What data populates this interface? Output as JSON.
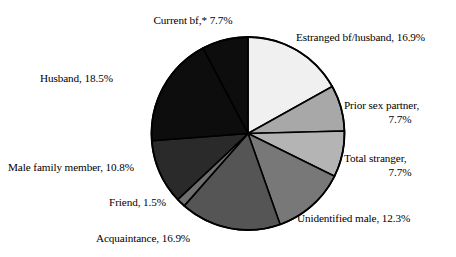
{
  "chart_data": {
    "type": "pie",
    "title": "",
    "subtitle": "",
    "xlabel": "",
    "ylabel": "",
    "legend_position": "none",
    "grid": false,
    "units": "percent",
    "start_angle_deg": 0,
    "direction": "clockwise",
    "total": 100.0,
    "categories": [
      "Estranged bf/husband",
      "Prior sex partner",
      "Total stranger",
      "Unidentified male",
      "Acquaintance",
      "Friend",
      "Male family member",
      "Husband",
      "Current bf,*"
    ],
    "values": [
      16.9,
      7.7,
      7.7,
      12.3,
      16.9,
      1.5,
      10.8,
      18.5,
      7.7
    ],
    "colors": [
      "#f0f0f0",
      "#a8a8a8",
      "#b4b4b4",
      "#787878",
      "#555555",
      "#6e6e6e",
      "#2a2a2a",
      "#0d0d0d",
      "#0d0d0d"
    ],
    "slice_border_color": "#000000",
    "annotations": [
      "* asterisk on 'Current bf' denotes a footnote marker"
    ],
    "slices": [
      {
        "name": "Estranged bf/husband",
        "value": 16.9,
        "label": "Estranged bf/husband, 16.9%",
        "color": "#f0f0f0"
      },
      {
        "name": "Prior sex partner",
        "value": 7.7,
        "label": "Prior sex partner, 7.7%",
        "color": "#a8a8a8"
      },
      {
        "name": "Total stranger",
        "value": 7.7,
        "label": "Total stranger, 7.7%",
        "color": "#b4b4b4"
      },
      {
        "name": "Unidentified male",
        "value": 12.3,
        "label": "Unidentified male, 12.3%",
        "color": "#787878"
      },
      {
        "name": "Acquaintance",
        "value": 16.9,
        "label": "Acquaintance, 16.9%",
        "color": "#555555"
      },
      {
        "name": "Friend",
        "value": 1.5,
        "label": "Friend, 1.5%",
        "color": "#6e6e6e"
      },
      {
        "name": "Male family member",
        "value": 10.8,
        "label": "Male family member, 10.8%",
        "color": "#2a2a2a"
      },
      {
        "name": "Husband",
        "value": 18.5,
        "label": "Husband, 18.5%",
        "color": "#0d0d0d"
      },
      {
        "name": "Current bf,*",
        "value": 7.7,
        "label": "Current bf,* 7.7%",
        "color": "#0d0d0d"
      }
    ]
  },
  "labels": {
    "current_bf": "Current bf,* 7.7%",
    "estranged": "Estranged bf/husband, 16.9%",
    "prior_sex_partner_line1": "Prior sex partner,",
    "prior_sex_partner_line2": "7.7%",
    "total_stranger_line1": "Total stranger,",
    "total_stranger_line2": "7.7%",
    "unidentified_male": "Unidentified male, 12.3%",
    "acquaintance": "Acquaintance, 16.9%",
    "friend": "Friend, 1.5%",
    "male_family_member": "Male family member, 10.8%",
    "husband": "Husband, 18.5%"
  },
  "geometry": {
    "center_x": 248,
    "center_y": 133.5,
    "radius": 96.5
  }
}
